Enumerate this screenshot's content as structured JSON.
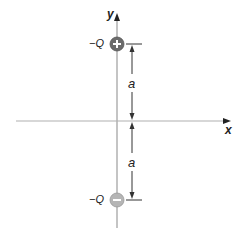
{
  "diagram": {
    "axes": {
      "x_label": "x",
      "y_label": "y"
    },
    "charges": [
      {
        "label": "−Q",
        "sign": "+",
        "position": "top",
        "fill": "#6b6b6b"
      },
      {
        "label": "−Q",
        "sign": "−",
        "position": "bottom",
        "fill": "#b5b5b5"
      }
    ],
    "dimensions": [
      {
        "label": "a",
        "span": "top charge to x-axis"
      },
      {
        "label": "a",
        "span": "x-axis to bottom charge"
      }
    ],
    "colors": {
      "axis": "#aaaaaa",
      "dimension_line": "#333333",
      "text": "#222222"
    }
  }
}
